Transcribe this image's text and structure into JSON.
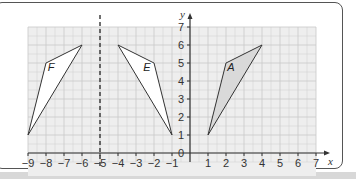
{
  "diagram": {
    "axes": {
      "x_label": "x",
      "y_label": "y",
      "x_range": [
        -9,
        7
      ],
      "y_range": [
        0,
        7
      ]
    },
    "x_ticks": [
      "−9",
      "−8",
      "−7",
      "−6",
      "−5",
      "−4",
      "−3",
      "−2",
      "−1",
      "1",
      "2",
      "3",
      "4",
      "5",
      "6",
      "7"
    ],
    "y_ticks": [
      "1",
      "2",
      "3",
      "4",
      "5",
      "6",
      "7"
    ],
    "origin_label": "0",
    "mirror_line": {
      "x": -5,
      "style": "dashed"
    },
    "shapes": [
      {
        "label": "A",
        "vertices": [
          [
            1,
            1
          ],
          [
            2,
            5
          ],
          [
            4,
            6
          ]
        ],
        "fill": "#d9d9d9"
      },
      {
        "label": "E",
        "vertices": [
          [
            -1,
            1
          ],
          [
            -2,
            5
          ],
          [
            -4,
            6
          ]
        ],
        "fill": "#ffffff"
      },
      {
        "label": "F",
        "vertices": [
          [
            -9,
            1
          ],
          [
            -8,
            5
          ],
          [
            -6,
            6
          ]
        ],
        "fill": "#ffffff"
      }
    ],
    "colors": {
      "grid_bg": "#eeeeee",
      "grid_line": "#c8c8c8",
      "axis": "#333333",
      "shape_stroke": "#333333"
    }
  },
  "chart_data": {
    "type": "scatter",
    "title": "",
    "xlabel": "x",
    "ylabel": "y",
    "xlim": [
      -9,
      7
    ],
    "ylim": [
      0,
      7
    ],
    "grid": true,
    "series": [
      {
        "name": "A",
        "x": [
          1,
          2,
          4
        ],
        "y": [
          1,
          5,
          6
        ]
      },
      {
        "name": "E",
        "x": [
          -1,
          -2,
          -4
        ],
        "y": [
          1,
          5,
          6
        ]
      },
      {
        "name": "F",
        "x": [
          -9,
          -8,
          -6
        ],
        "y": [
          1,
          5,
          6
        ]
      }
    ],
    "annotations": [
      "dashed vertical line at x = -5"
    ]
  }
}
